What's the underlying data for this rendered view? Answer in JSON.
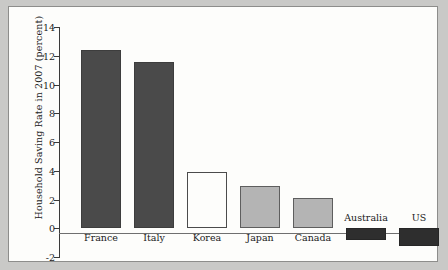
{
  "chart_data": {
    "type": "bar",
    "title": "",
    "subtitle": "",
    "xlabel": "",
    "ylabel": "Household Saving Rate in 2007 (percent)",
    "categories": [
      "France",
      "Italy",
      "Korea",
      "Japan",
      "Canada",
      "Australia",
      "US"
    ],
    "values": [
      12.4,
      11.6,
      3.9,
      2.95,
      2.1,
      -0.8,
      -1.2
    ],
    "ylim": [
      -2,
      14
    ],
    "yticks": [
      "14",
      "12",
      "10",
      "8",
      "6",
      "4",
      "2",
      "0",
      "-2"
    ],
    "ytick_values": [
      14,
      12,
      10,
      8,
      6,
      4,
      2,
      0,
      -2
    ],
    "grid": "none",
    "legend": "none",
    "bar_styles": [
      "dark",
      "dark",
      "open",
      "light",
      "light",
      "black",
      "black"
    ],
    "colors": {
      "dark_bar": "#4a4a4a",
      "open_bar": "#fdfdfb",
      "light_bar": "#b4b4b4",
      "black_bar": "#2e2e2e",
      "axis": "#3a3a3a",
      "zero_line": "#6f6f6f",
      "panel_background": "#fdfdfb",
      "figure_background": "#c9c9c7",
      "text": "#1b1b1b"
    }
  }
}
